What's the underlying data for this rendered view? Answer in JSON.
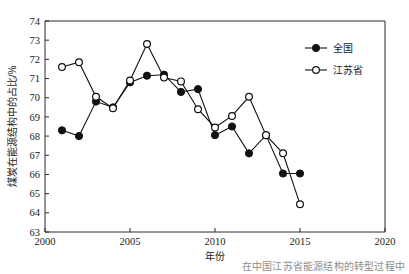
{
  "chart_data": {
    "type": "line",
    "title": "",
    "subtitle": "",
    "xlabel": "年份",
    "ylabel": "煤炭在能源结构中的占比/%",
    "xlim": [
      2000,
      2020
    ],
    "ylim": [
      63,
      74
    ],
    "xticks": [
      2000,
      2005,
      2010,
      2015,
      2020
    ],
    "yticks": [
      63,
      64,
      65,
      66,
      67,
      68,
      69,
      70,
      71,
      72,
      73,
      74
    ],
    "xtick_labels": [
      "2000",
      "2005",
      "2010",
      "2015",
      "2020"
    ],
    "ytick_labels": [
      "63",
      "64",
      "65",
      "66",
      "67",
      "68",
      "69",
      "70",
      "71",
      "72",
      "73",
      "74"
    ],
    "grid": false,
    "legend_position": "top-right",
    "x": [
      2001,
      2002,
      2003,
      2004,
      2005,
      2006,
      2007,
      2008,
      2009,
      2010,
      2011,
      2012,
      2013,
      2014,
      2015
    ],
    "series": [
      {
        "name": "全国",
        "marker": "filled-circle",
        "color": "#111111",
        "values": [
          68.3,
          68.0,
          69.8,
          69.5,
          70.8,
          71.15,
          71.2,
          70.3,
          70.45,
          68.05,
          68.5,
          67.1,
          68.05,
          66.05,
          66.05
        ]
      },
      {
        "name": "江苏省",
        "marker": "open-circle",
        "color": "#111111",
        "values": [
          71.6,
          71.85,
          70.05,
          69.45,
          70.9,
          72.8,
          71.05,
          70.85,
          69.4,
          68.45,
          69.05,
          70.05,
          68.05,
          67.1,
          64.45
        ]
      }
    ],
    "annotations": []
  },
  "legend": {
    "entries": [
      {
        "label": "全国",
        "marker": "filled-circle"
      },
      {
        "label": "江苏省",
        "marker": "open-circle"
      }
    ]
  },
  "axes": {
    "x_title": "年份",
    "y_title": "煤炭在能源结构中的占比/%"
  },
  "caption": {
    "text": "在中国江苏省能源结构的转型过程中"
  }
}
